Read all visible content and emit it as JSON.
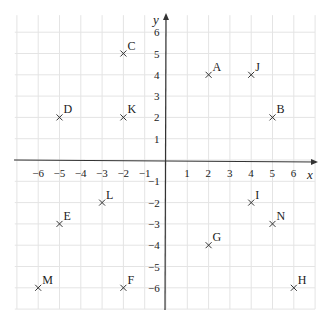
{
  "chart_data": {
    "type": "scatter",
    "title": "",
    "xlabel": "x",
    "ylabel": "y",
    "xlim": [
      -7,
      7
    ],
    "ylim": [
      -7,
      7
    ],
    "grid": true,
    "legend": null,
    "x_ticks": [
      -6,
      -5,
      -4,
      -3,
      -2,
      -1,
      1,
      2,
      3,
      4,
      5,
      6
    ],
    "y_ticks": [
      -6,
      -5,
      -4,
      -3,
      -2,
      -1,
      1,
      2,
      3,
      4,
      5,
      6
    ],
    "marker": "x",
    "points": [
      {
        "label": "A",
        "x": 2,
        "y": 4
      },
      {
        "label": "B",
        "x": 5,
        "y": 2
      },
      {
        "label": "C",
        "x": -2,
        "y": 5
      },
      {
        "label": "D",
        "x": -5,
        "y": 2
      },
      {
        "label": "E",
        "x": -5,
        "y": -3
      },
      {
        "label": "F",
        "x": -2,
        "y": -6
      },
      {
        "label": "G",
        "x": 2,
        "y": -4
      },
      {
        "label": "H",
        "x": 6,
        "y": -6
      },
      {
        "label": "I",
        "x": 4,
        "y": -2
      },
      {
        "label": "J",
        "x": 4,
        "y": 4
      },
      {
        "label": "K",
        "x": -2,
        "y": 2
      },
      {
        "label": "L",
        "x": -3,
        "y": -2
      },
      {
        "label": "M",
        "x": -6,
        "y": -6
      },
      {
        "label": "N",
        "x": 5,
        "y": -3
      }
    ]
  },
  "style": {
    "grid_color": "#e4e4e4",
    "axis_color": "#333333",
    "marker_color": "#333333"
  }
}
